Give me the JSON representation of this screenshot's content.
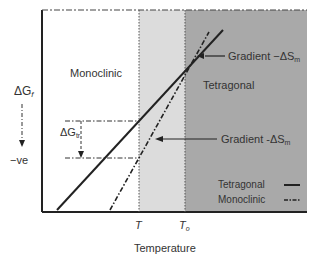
{
  "diagram": {
    "y_axis": {
      "label_main": "ΔG",
      "label_sub": "f",
      "bottom_label": "−ve"
    },
    "x_axis": {
      "label": "Temperature",
      "ticks": [
        {
          "main": "T",
          "sub": ""
        },
        {
          "main": "T",
          "sub": "o"
        }
      ]
    },
    "regions": [
      {
        "name": "Monoclinic",
        "fill": "#ffffff"
      },
      {
        "name": "transition band",
        "fill": "#dcdcdc"
      },
      {
        "name": "Tetragonal",
        "fill": "#a9a9a9"
      }
    ],
    "annotations": {
      "gradient_upper": {
        "prefix": "Gradient −ΔS",
        "sub": "m"
      },
      "gradient_lower": {
        "prefix": "Gradient -ΔS",
        "sub": "m"
      },
      "delta_g_tr": {
        "main": "ΔG",
        "sub": "tr"
      }
    },
    "legend": [
      {
        "label": "Tetragonal",
        "style": "solid"
      },
      {
        "label": "Monoclinic",
        "style": "dash-dot"
      }
    ],
    "colors": {
      "line": "#222222",
      "light_band": "#dcdcdc",
      "dark_region": "#a9a9a9"
    }
  }
}
